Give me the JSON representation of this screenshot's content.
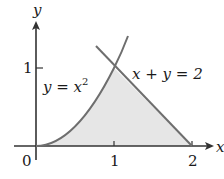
{
  "diagram": {
    "type": "region-between-curves",
    "axes": {
      "x_label": "x",
      "y_label": "y",
      "origin_label": "0",
      "x_ticks": [
        "1",
        "2"
      ],
      "y_ticks": [
        "1"
      ]
    },
    "curves": [
      {
        "name": "parabola",
        "equation_lhs": "y = x",
        "exponent": "2"
      },
      {
        "name": "line",
        "equation": "x + y = 2"
      }
    ],
    "region": {
      "description": "Shaded region bounded by y = x^2, x + y = 2 and the x-axis",
      "fill_color": "#e6e6e6",
      "vertices": [
        [
          0,
          0
        ],
        [
          1,
          1
        ],
        [
          2,
          0
        ]
      ]
    },
    "colors": {
      "axis": "#333333",
      "curve": "#6e6e6e",
      "fill": "#e6e6e6"
    }
  }
}
